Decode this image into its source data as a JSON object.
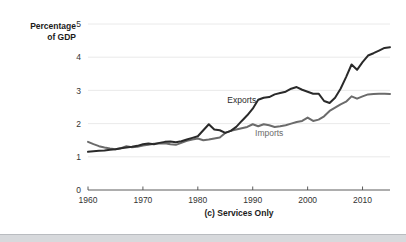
{
  "figure": {
    "background_color": "#ffffff",
    "caption": "(c) Services Only"
  },
  "footer": {
    "bar_color": "#d7d9dc"
  },
  "axes": {
    "y_title_line1": "Percentage",
    "y_title_line2": "of GDP",
    "y_ticks": [
      "0",
      "1",
      "2",
      "3",
      "4",
      "5"
    ],
    "x_ticks": [
      "1960",
      "1970",
      "1980",
      "1990",
      "2000",
      "2010"
    ]
  },
  "series_labels": {
    "exports": "Exports",
    "imports": "Imports"
  },
  "chart_data": {
    "type": "line",
    "title": "(c) Services Only",
    "xlabel": "",
    "ylabel": "Percentage of GDP",
    "xlim": [
      1960,
      2015
    ],
    "ylim": [
      0,
      5
    ],
    "yticks": [
      0,
      1,
      2,
      3,
      4,
      5
    ],
    "xticks": [
      1960,
      1970,
      1980,
      1990,
      2000,
      2010
    ],
    "grid": "horizontal",
    "legend": "inline-annotations",
    "colors": {
      "exports": "#2a2a2a",
      "imports": "#6b6b6b",
      "gridline": "#e4e4e4",
      "axis": "#4a4a4a"
    },
    "x": [
      1960,
      1961,
      1962,
      1963,
      1964,
      1965,
      1966,
      1967,
      1968,
      1969,
      1970,
      1971,
      1972,
      1973,
      1974,
      1975,
      1976,
      1977,
      1978,
      1979,
      1980,
      1981,
      1982,
      1983,
      1984,
      1985,
      1986,
      1987,
      1988,
      1989,
      1990,
      1991,
      1992,
      1993,
      1994,
      1995,
      1996,
      1997,
      1998,
      1999,
      2000,
      2001,
      2002,
      2003,
      2004,
      2005,
      2006,
      2007,
      2008,
      2009,
      2010,
      2011,
      2012,
      2013,
      2014,
      2015
    ],
    "series": [
      {
        "name": "Exports",
        "color": "#2a2a2a",
        "label_position": {
          "x": 1988,
          "y": 2.62
        },
        "values": [
          1.15,
          1.17,
          1.18,
          1.19,
          1.21,
          1.23,
          1.26,
          1.28,
          1.3,
          1.33,
          1.38,
          1.4,
          1.38,
          1.42,
          1.45,
          1.46,
          1.44,
          1.47,
          1.52,
          1.57,
          1.62,
          1.8,
          1.98,
          1.82,
          1.8,
          1.72,
          1.78,
          1.9,
          2.08,
          2.25,
          2.45,
          2.72,
          2.78,
          2.8,
          2.88,
          2.92,
          2.96,
          3.05,
          3.1,
          3.02,
          2.96,
          2.9,
          2.9,
          2.68,
          2.62,
          2.78,
          3.05,
          3.4,
          3.78,
          3.62,
          3.85,
          4.05,
          4.12,
          4.2,
          4.28,
          4.3
        ]
      },
      {
        "name": "Imports",
        "color": "#6b6b6b",
        "label_position": {
          "x": 1993,
          "y": 1.62
        },
        "values": [
          1.45,
          1.38,
          1.32,
          1.28,
          1.25,
          1.23,
          1.26,
          1.32,
          1.29,
          1.3,
          1.34,
          1.36,
          1.39,
          1.4,
          1.41,
          1.38,
          1.36,
          1.42,
          1.48,
          1.52,
          1.55,
          1.5,
          1.52,
          1.55,
          1.58,
          1.72,
          1.78,
          1.82,
          1.86,
          1.9,
          1.98,
          1.92,
          1.98,
          1.95,
          1.9,
          1.92,
          1.95,
          2.0,
          2.05,
          2.08,
          2.18,
          2.08,
          2.12,
          2.22,
          2.38,
          2.48,
          2.58,
          2.66,
          2.82,
          2.75,
          2.82,
          2.88,
          2.89,
          2.9,
          2.9,
          2.89
        ]
      }
    ]
  }
}
